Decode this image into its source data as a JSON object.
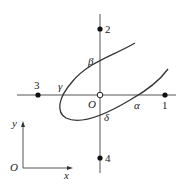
{
  "diagram": {
    "points": [
      {
        "label": "1",
        "x": 165,
        "y": 95
      },
      {
        "label": "2",
        "x": 100,
        "y": 29
      },
      {
        "label": "3",
        "x": 38,
        "y": 95
      },
      {
        "label": "4",
        "x": 100,
        "y": 158
      }
    ],
    "origin_label": "O",
    "intersections": {
      "alpha": "α",
      "beta": "β",
      "gamma": "γ",
      "delta": "δ"
    },
    "axes_inset": {
      "origin": "O",
      "x": "x",
      "y": "y"
    },
    "colors": {
      "line": "#333333",
      "axis": "#555555",
      "point": "#111111"
    }
  }
}
